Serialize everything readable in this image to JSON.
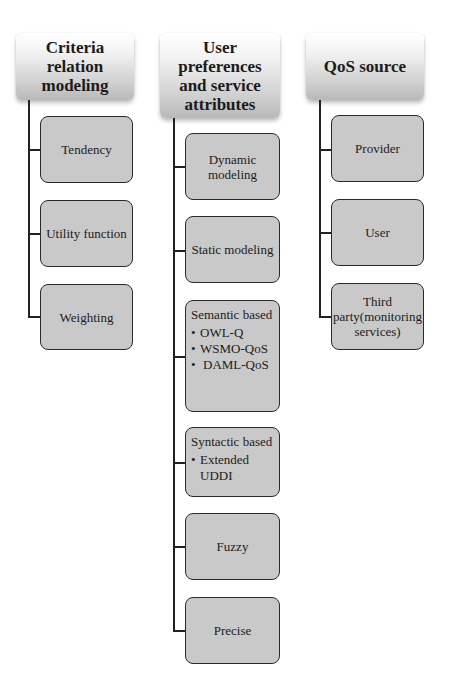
{
  "diagram": {
    "columns": [
      {
        "title": "Criteria relation modeling",
        "children": [
          {
            "label": "Tendency"
          },
          {
            "label": "Utility function"
          },
          {
            "label": "Weighting"
          }
        ]
      },
      {
        "title": "User preferences and service attributes",
        "children": [
          {
            "label": "Dynamic modeling"
          },
          {
            "label": "Static modeling"
          },
          {
            "label": "Semantic based",
            "items": [
              "OWL-Q",
              "WSMO-QoS",
              "DAML-QoS"
            ]
          },
          {
            "label": "Syntactic based",
            "items": [
              "Extended UDDI"
            ]
          },
          {
            "label": "Fuzzy"
          },
          {
            "label": "Precise"
          }
        ]
      },
      {
        "title": "QoS source",
        "children": [
          {
            "label": "Provider"
          },
          {
            "label": "User"
          },
          {
            "label": "Third party(monitoring services)"
          }
        ]
      }
    ],
    "colors": {
      "header_top": "#ffffff",
      "header_bottom": "#b8b8b8",
      "child_fill": "#c9c9c9",
      "border": "#2a2a2a",
      "connector": "#222222"
    }
  }
}
